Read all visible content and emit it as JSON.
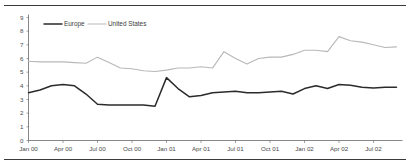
{
  "chart_data": {
    "type": "line",
    "title": "",
    "subtitle": "",
    "xlabel": "",
    "ylabel": "",
    "ylim": [
      0,
      9
    ],
    "yticks": [
      "0",
      "1",
      "2",
      "3",
      "4",
      "5",
      "6",
      "7",
      "8",
      "9"
    ],
    "grid": false,
    "legend_position": "top-left",
    "x_tick_labels": [
      "Jan 00",
      "Apr 00",
      "Jul 00",
      "Oct 00",
      "Jan 01",
      "Apr 01",
      "Jul 01",
      "Oct 01",
      "Jan 02",
      "Apr 02",
      "Jul 02"
    ],
    "x": [
      "Jan 00",
      "Feb 00",
      "Mar 00",
      "Apr 00",
      "May 00",
      "Jun 00",
      "Jul 00",
      "Aug 00",
      "Sep 00",
      "Oct 00",
      "Nov 00",
      "Dec 00",
      "Jan 01",
      "Feb 01",
      "Mar 01",
      "Apr 01",
      "May 01",
      "Jun 01",
      "Jul 01",
      "Aug 01",
      "Sep 01",
      "Oct 01",
      "Nov 01",
      "Dec 01",
      "Jan 02",
      "Feb 02",
      "Mar 02",
      "Apr 02",
      "May 02",
      "Jun 02",
      "Jul 02",
      "Aug 02",
      "Sep 02"
    ],
    "series": [
      {
        "name": "Europe",
        "color": "#2b2b2b",
        "values": [
          3.5,
          3.7,
          4.0,
          4.1,
          4.0,
          3.4,
          2.65,
          2.6,
          2.6,
          2.6,
          2.6,
          2.5,
          4.6,
          3.8,
          3.2,
          3.3,
          3.5,
          3.55,
          3.6,
          3.5,
          3.5,
          3.55,
          3.6,
          3.4,
          3.8,
          4.0,
          3.8,
          4.1,
          4.05,
          3.9,
          3.85,
          3.9,
          3.9
        ]
      },
      {
        "name": "United States",
        "color": "#b8b8b8",
        "values": [
          5.8,
          5.75,
          5.75,
          5.75,
          5.7,
          5.65,
          6.1,
          5.7,
          5.3,
          5.25,
          5.1,
          5.05,
          5.15,
          5.3,
          5.3,
          5.4,
          5.3,
          6.5,
          6.0,
          5.6,
          6.0,
          6.1,
          6.1,
          6.3,
          6.6,
          6.6,
          6.5,
          7.6,
          7.3,
          7.2,
          7.0,
          6.8,
          6.85
        ]
      }
    ]
  },
  "legend": {
    "items": [
      {
        "label": "Europe",
        "color": "#2b2b2b"
      },
      {
        "label": "United States",
        "color": "#b8b8b8"
      }
    ]
  }
}
